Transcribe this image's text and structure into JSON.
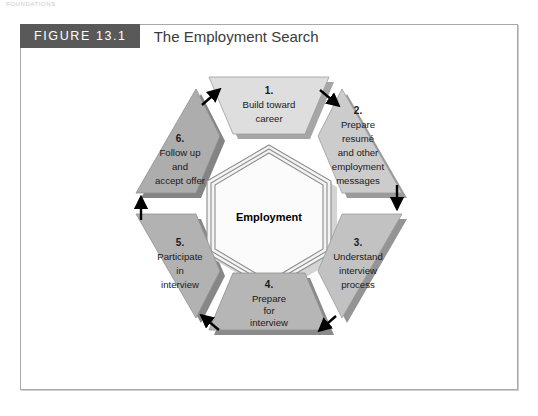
{
  "page": {
    "running_head": "FOUNDATIONS"
  },
  "figure": {
    "number_label": "FIGURE 13.1",
    "title": "The Employment Search",
    "number_bar_color": "#595959",
    "frame_border_color": "#a9a9a9",
    "background_color": "#ffffff"
  },
  "diagram": {
    "type": "cycle",
    "center": {
      "label": "Employment",
      "shape": "hexagon",
      "fill": "#f2f2f2",
      "border": "#8d8d8d"
    },
    "steps": [
      {
        "number": "1.",
        "lines": [
          "Build toward",
          "career"
        ],
        "position": "top",
        "fill": "#dedede",
        "shadow": "#a6a6a6"
      },
      {
        "number": "2.",
        "lines": [
          "Prepare",
          "resumé",
          "and other",
          "employment",
          "messages"
        ],
        "position": "top-right",
        "fill": "#cccccc",
        "shadow": "#9a9a9a"
      },
      {
        "number": "3.",
        "lines": [
          "Understand",
          "interview",
          "process"
        ],
        "position": "bottom-right",
        "fill": "#c2c2c2",
        "shadow": "#949494"
      },
      {
        "number": "4.",
        "lines": [
          "Prepare",
          "for",
          "interview"
        ],
        "position": "bottom",
        "fill": "#b6b6b6",
        "shadow": "#8a8a8a"
      },
      {
        "number": "5.",
        "lines": [
          "Participate",
          "in",
          "interview"
        ],
        "position": "bottom-left",
        "fill": "#b2b2b2",
        "shadow": "#878787"
      },
      {
        "number": "6.",
        "lines": [
          "Follow up",
          "and",
          "accept offer"
        ],
        "position": "top-left",
        "fill": "#adadad",
        "shadow": "#848484"
      }
    ],
    "arrows": [
      {
        "from": "1",
        "to": "2",
        "direction": "down-right"
      },
      {
        "from": "2",
        "to": "3",
        "direction": "down"
      },
      {
        "from": "3",
        "to": "4",
        "direction": "down-left"
      },
      {
        "from": "4",
        "to": "5",
        "direction": "up-left"
      },
      {
        "from": "5",
        "to": "6",
        "direction": "up"
      },
      {
        "from": "6",
        "to": "1",
        "direction": "up-right"
      }
    ],
    "arrow_color": "#000000"
  }
}
